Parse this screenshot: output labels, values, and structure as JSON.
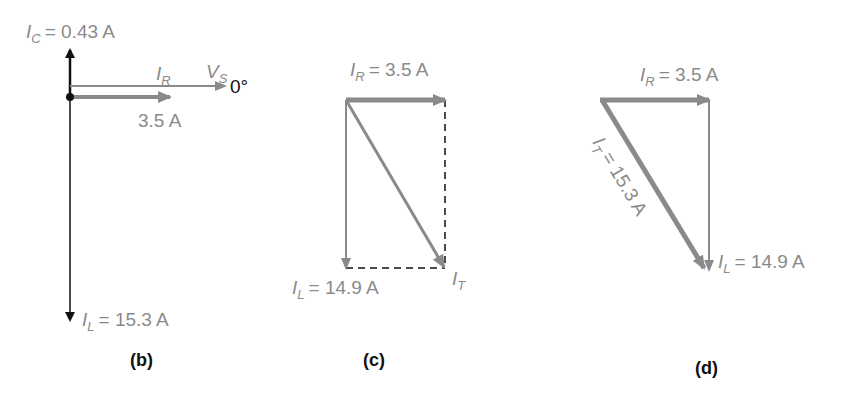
{
  "colors": {
    "gray_vector": "#8a8a8a",
    "dark_vector": "#111111",
    "label_gray": "#8a8a8a",
    "caption": "#111111"
  },
  "panel_b": {
    "caption": "(b)",
    "ic_symbol": "I",
    "ic_sub": "C",
    "ic_value": "= 0.43 A",
    "ir_symbol": "I",
    "ir_sub": "R",
    "vs_symbol": "V",
    "vs_sub": "S",
    "vs_angle": "0°",
    "ir_value": "3.5 A",
    "il_symbol": "I",
    "il_sub": "L",
    "il_value": "= 15.3 A"
  },
  "panel_c": {
    "caption": "(c)",
    "ir_symbol": "I",
    "ir_sub": "R",
    "ir_value": "= 3.5 A",
    "il_symbol": "I",
    "il_sub": "L",
    "il_value": "= 14.9 A",
    "it_symbol": "I",
    "it_sub": "T"
  },
  "panel_d": {
    "caption": "(d)",
    "ir_symbol": "I",
    "ir_sub": "R",
    "ir_value": "= 3.5 A",
    "it_symbol": "I",
    "it_sub": "T",
    "it_value": "= 15.3 A",
    "il_symbol": "I",
    "il_sub": "L",
    "il_value": "= 14.9 A"
  }
}
